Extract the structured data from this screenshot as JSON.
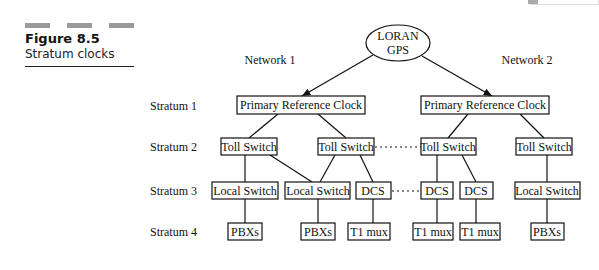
{
  "figure": {
    "number": "Figure 8.5",
    "caption": "Stratum clocks"
  },
  "diagram": {
    "root": {
      "line1": "LORAN",
      "line2": "GPS"
    },
    "networks": [
      "Network 1",
      "Network 2"
    ],
    "strata": [
      "Stratum 1",
      "Stratum 2",
      "Stratum 3",
      "Stratum 4"
    ],
    "stratum1": [
      "Primary Reference Clock",
      "Primary Reference Clock"
    ],
    "stratum2": [
      "Toll Switch",
      "Toll Switch",
      "Toll Switch",
      "Toll Switch"
    ],
    "stratum3": [
      "Local Switch",
      "Local Switch",
      "DCS",
      "DCS",
      "DCS",
      "Local Switch"
    ],
    "stratum4": [
      "PBXs",
      "PBXs",
      "T1 mux",
      "T1 mux",
      "T1 mux",
      "PBXs"
    ]
  }
}
